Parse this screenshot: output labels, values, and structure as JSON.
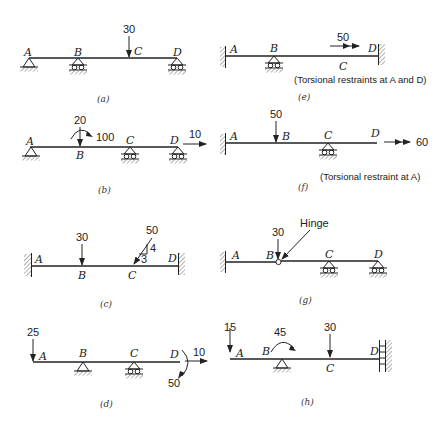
{
  "figure": {
    "panels": [
      {
        "id": "a",
        "caption": "(a)",
        "labels": {
          "A": "A",
          "B": "B",
          "C": "C",
          "D": "D"
        },
        "supports": {
          "A": "pin",
          "B": "roller",
          "D": "roller"
        },
        "loads": [
          {
            "at": "C",
            "type": "vertical-force",
            "value": "30"
          }
        ]
      },
      {
        "id": "b",
        "caption": "(b)",
        "labels": {
          "A": "A",
          "B": "B",
          "C": "C",
          "D": "D"
        },
        "supports": {
          "A": "pin",
          "C": "roller",
          "D": "roller"
        },
        "loads": [
          {
            "at": "B",
            "type": "vertical-force",
            "value": "20"
          },
          {
            "at": "B",
            "type": "moment",
            "value": "100"
          },
          {
            "at": "D",
            "type": "axial-force",
            "value": "10"
          }
        ]
      },
      {
        "id": "c",
        "caption": "(c)",
        "labels": {
          "A": "A",
          "B": "B",
          "C": "C",
          "D": "D"
        },
        "supports": {
          "A": "fixed",
          "D": "fixed"
        },
        "loads": [
          {
            "at": "B",
            "type": "vertical-force",
            "value": "30"
          },
          {
            "at": "C",
            "type": "inclined-force",
            "value": "50",
            "slope_rise": "4",
            "slope_run": "3"
          }
        ]
      },
      {
        "id": "d",
        "caption": "(d)",
        "labels": {
          "A": "A",
          "B": "B",
          "C": "C",
          "D": "D"
        },
        "supports": {
          "B": "pin",
          "C": "roller"
        },
        "loads": [
          {
            "at": "A",
            "type": "vertical-force",
            "value": "25"
          },
          {
            "at": "D",
            "type": "moment",
            "value": "50"
          },
          {
            "at": "D",
            "type": "axial-force",
            "value": "10"
          }
        ]
      },
      {
        "id": "e",
        "caption": "(e)",
        "labels": {
          "A": "A",
          "B": "B",
          "C": "C",
          "D": "D"
        },
        "supports": {
          "A": "fixed",
          "B": "roller",
          "D": "fixed"
        },
        "loads": [
          {
            "at": "C",
            "type": "torque",
            "value": "50"
          }
        ],
        "note": "(Torsional restraints at A and D)"
      },
      {
        "id": "f",
        "caption": "(f)",
        "labels": {
          "A": "A",
          "B": "B",
          "C": "C",
          "D": "D"
        },
        "supports": {
          "A": "fixed",
          "C": "roller"
        },
        "loads": [
          {
            "at": "B",
            "type": "vertical-force",
            "value": "50"
          },
          {
            "at": "D",
            "type": "torque",
            "value": "60"
          }
        ],
        "note": "(Torsional restraint at A)"
      },
      {
        "id": "g",
        "caption": "(g)",
        "labels": {
          "A": "A",
          "B": "B",
          "C": "C",
          "D": "D"
        },
        "supports": {
          "A": "fixed",
          "C": "roller",
          "D": "roller"
        },
        "loads": [
          {
            "at": "B",
            "type": "vertical-force",
            "value": "30"
          }
        ],
        "callout": "Hinge"
      },
      {
        "id": "h",
        "caption": "(h)",
        "labels": {
          "A": "A",
          "B": "B",
          "C": "C",
          "D": "D"
        },
        "supports": {
          "B": "pin",
          "D": "guided-roller-wall"
        },
        "loads": [
          {
            "at": "A",
            "type": "vertical-force",
            "value": "15"
          },
          {
            "at": "B",
            "type": "moment",
            "value": "45"
          },
          {
            "at": "C",
            "type": "vertical-force",
            "value": "30"
          }
        ]
      }
    ]
  }
}
